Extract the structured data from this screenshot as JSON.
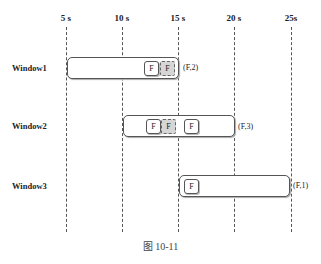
{
  "axis": {
    "ticks": [
      "5 s",
      "10 s",
      "15 s",
      "20 s",
      "25s"
    ]
  },
  "windows": [
    {
      "label": "Window1",
      "range": [
        5,
        15
      ],
      "elements": [
        "F",
        "F"
      ],
      "fired_element_index": 1,
      "result": "(F,2)"
    },
    {
      "label": "Window2",
      "range": [
        10,
        20
      ],
      "elements": [
        "F",
        "F",
        "F"
      ],
      "fired_element_index": 1,
      "result": "(F,3)"
    },
    {
      "label": "Window3",
      "range": [
        15,
        25
      ],
      "elements": [
        "F"
      ],
      "result": "(F,1)"
    }
  ],
  "caption": "图 10-11",
  "colors": {
    "fired_element_fill": "#d6d6d6",
    "line": "#555555"
  }
}
